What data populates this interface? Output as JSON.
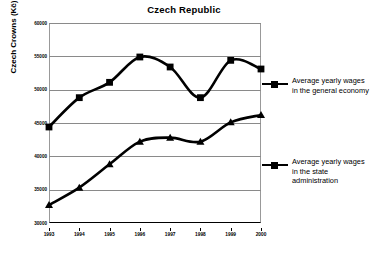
{
  "chart_data": {
    "type": "line",
    "title": "Czech Republic",
    "xlabel": "",
    "ylabel": "Czech Crowns (Kč)",
    "categories": [
      "1993",
      "1994",
      "1995",
      "1996",
      "1997",
      "1998",
      "1999",
      "2000"
    ],
    "x": [
      1993,
      1994,
      1995,
      1996,
      1997,
      1998,
      1999,
      2000
    ],
    "ylim": [
      30000,
      60000
    ],
    "yticks": [
      "30000",
      "35000",
      "40000",
      "45000",
      "50000",
      "55000",
      "60000"
    ],
    "ytick_values": [
      30000,
      35000,
      40000,
      45000,
      50000,
      55000,
      60000
    ],
    "grid": true,
    "legend_position": "right",
    "series": [
      {
        "name": "Average yearly wages in the general economy",
        "marker": "square",
        "color": "#000000",
        "values": [
          44400,
          48800,
          51100,
          54900,
          53400,
          48800,
          54400,
          53100
        ]
      },
      {
        "name": "Average yearly wages in the state administration",
        "marker": "triangle",
        "color": "#000000",
        "values": [
          32700,
          35300,
          38800,
          42200,
          42800,
          42200,
          45100,
          46200
        ]
      }
    ]
  },
  "legend": {
    "entries": [
      {
        "label": "Average yearly wages in the general economy",
        "marker": "square-line-marker"
      },
      {
        "label": "Average yearly wages in the state administration",
        "marker": "square-line-marker"
      }
    ]
  }
}
